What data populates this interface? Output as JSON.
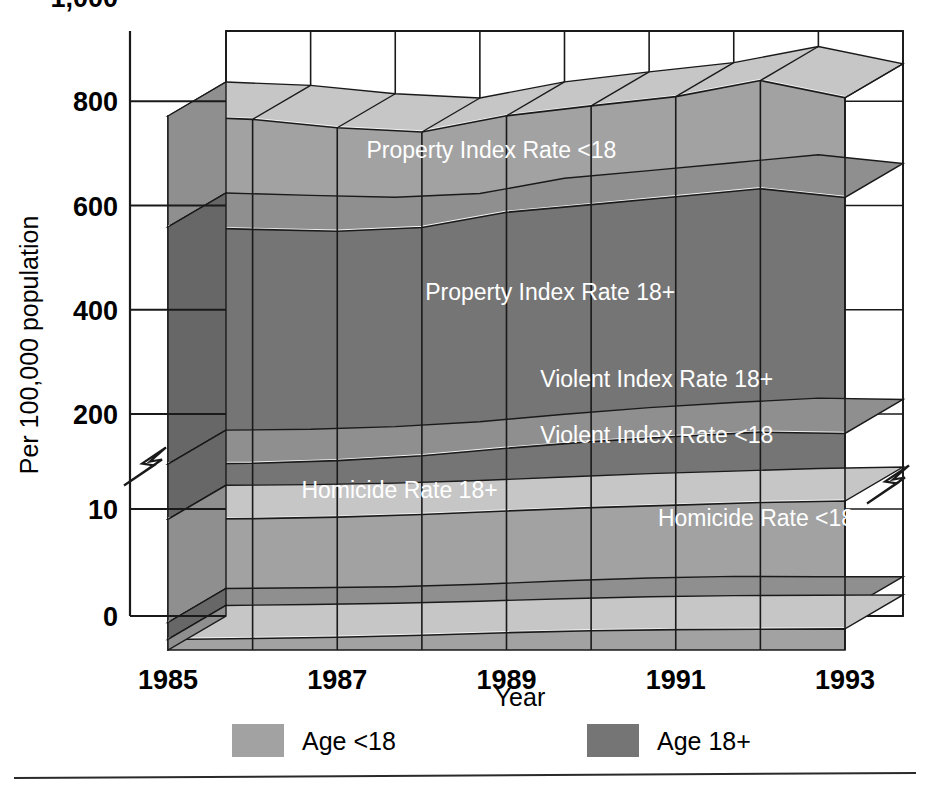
{
  "chart_data": {
    "type": "area",
    "subtype": "3d-stacked-area",
    "title": "",
    "xlabel": "Year",
    "ylabel": "Per 100,000 population",
    "x": [
      1985,
      1986,
      1987,
      1988,
      1989,
      1990,
      1991,
      1992,
      1993
    ],
    "tick_labels_x": [
      "1985",
      "1987",
      "1989",
      "1991",
      "1993"
    ],
    "tick_values_x": [
      1985,
      1987,
      1989,
      1991,
      1993
    ],
    "tick_labels_y": [
      "0",
      "10",
      "200",
      "400",
      "600",
      "800",
      "1,000"
    ],
    "tick_values_y": [
      0,
      10,
      200,
      400,
      600,
      800,
      1000
    ],
    "ylim": [
      0,
      1000
    ],
    "axis_break": true,
    "axis_break_between": [
      10,
      200
    ],
    "grid": true,
    "legend_position": "bottom",
    "series": [
      {
        "name": "Homicide Rate <18",
        "age_group": "Age <18",
        "color": "#a2a2a2",
        "values": [
          5.5,
          6.0,
          6.6,
          7.7,
          9.0,
          10.0,
          10.6,
          10.8,
          11.0
        ]
      },
      {
        "name": "Homicide Rate 18+",
        "age_group": "Age 18+",
        "color": "#757575",
        "values": [
          8.8,
          8.7,
          8.6,
          8.8,
          9.3,
          9.8,
          10.0,
          9.6,
          9.5
        ]
      },
      {
        "name": "Violent Index Rate <18",
        "age_group": "Age <18",
        "color": "#a2a2a2",
        "values": [
          305,
          312,
          328,
          356,
          394,
          430,
          457,
          486,
          502
        ]
      },
      {
        "name": "Violent Index Rate 18+",
        "age_group": "Age 18+",
        "color": "#757575",
        "values": [
          614,
          616,
          630,
          655,
          698,
          732,
          758,
          776,
          746
        ]
      },
      {
        "name": "Property Index Rate 18+",
        "age_group": "Age 18+",
        "color": "#757575",
        "values": [
          2540,
          2505,
          2455,
          2440,
          2520,
          2530,
          2560,
          2600,
          2520
        ]
      },
      {
        "name": "Property Index Rate <18",
        "age_group": "Age <18",
        "color": "#a2a2a2",
        "values": [
          1185,
          1175,
          1105,
          1020,
          1030,
          1055,
          1070,
          1155,
          1065
        ]
      }
    ],
    "stacked_tops": [
      905,
      920,
      915,
      805,
      835,
      850,
      855,
      800,
      905,
      905,
      860
    ],
    "band_labels": [
      {
        "text": "Property Index Rate <18",
        "x_frac": 0.44,
        "y_frac": 0.205
      },
      {
        "text": "Property Index Rate 18+",
        "x_frac": 0.52,
        "y_frac": 0.435
      },
      {
        "text": "Violent Index Rate 18+",
        "x_frac": 0.665,
        "y_frac": 0.575
      },
      {
        "text": "Violent Index Rate <18",
        "x_frac": 0.665,
        "y_frac": 0.665
      },
      {
        "text": "Homicide Rate 18+",
        "x_frac": 0.315,
        "y_frac": 0.755
      },
      {
        "text": "Homicide Rate <18",
        "x_frac": 0.8,
        "y_frac": 0.8
      }
    ]
  },
  "axes": {
    "ylabel": "Per 100,000 population",
    "xlabel": "Year",
    "y_ticks": [
      "1,000",
      "800",
      "600",
      "400",
      "200",
      "10",
      "0"
    ],
    "x_ticks": [
      "1985",
      "1987",
      "1989",
      "1991",
      "1993"
    ]
  },
  "legend": {
    "items": [
      {
        "label": "Age <18",
        "color": "#a2a2a2"
      },
      {
        "label": "Age 18+",
        "color": "#757575"
      }
    ]
  },
  "colors": {
    "light_gray": "#a2a2a2",
    "dark_gray": "#757575",
    "light_gray_top": "#c8c8c8",
    "dark_gray_top": "#9a9a9a",
    "highlight": "#ffffff",
    "outline": "#1a1a1a",
    "background": "#ffffff"
  }
}
